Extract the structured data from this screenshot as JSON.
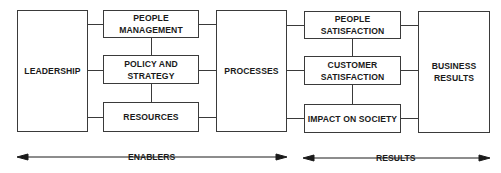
{
  "diagram": {
    "enablers": {
      "leadership": "LEADERSHIP",
      "people_management": [
        "PEOPLE",
        "MANAGEMENT"
      ],
      "policy_strategy": [
        "POLICY AND",
        "STRATEGY"
      ],
      "resources": "RESOURCES",
      "processes": "PROCESSES"
    },
    "results": {
      "people_satisfaction": [
        "PEOPLE",
        "SATISFACTION"
      ],
      "customer_satisfaction": [
        "CUSTOMER",
        "SATISFACTION"
      ],
      "impact_on_society": "IMPACT ON SOCIETY",
      "business_results": [
        "BUSINESS",
        "RESULTS"
      ]
    },
    "axis": {
      "enablers_label": "ENABLERS",
      "results_label": "RESULTS"
    },
    "colors": {
      "line": "#3a3a3a",
      "text": "#1a1a1a",
      "background": "#ffffff"
    }
  }
}
